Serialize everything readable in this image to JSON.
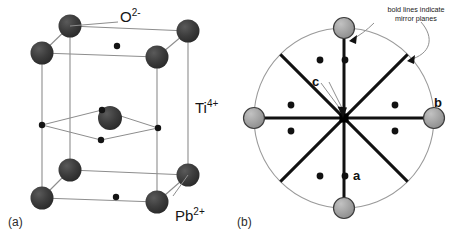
{
  "figure": {
    "kind": "crystal-structure-diagram",
    "background_color": "#ffffff",
    "ink_color": "#1a1a1a"
  },
  "panel_a": {
    "tag": "(a)",
    "description": "Perovskite tetragonal unit cell drawn in oblique projection",
    "labels": {
      "oxygen": {
        "element": "O",
        "charge": "2-",
        "text": "O2-"
      },
      "titanium": {
        "element": "Ti",
        "charge": "4+",
        "text": "Ti4+"
      },
      "lead": {
        "element": "Pb",
        "charge": "2+",
        "text": "Pb2+"
      }
    },
    "legend_colors": {
      "large_sphere": "#3a3a3a",
      "small_sphere": "#1a1a1a",
      "cell_edge": "#8a8a8a"
    },
    "atom_counts": {
      "large_corner_spheres": 8,
      "central_large_sphere": 1,
      "small_spheres": 6
    }
  },
  "panel_b": {
    "tag": "(b)",
    "description": "Projection down an axis showing mirror planes as bold lines through the centre",
    "note": "bold lines indicate\nmirror planes",
    "axis_labels": {
      "a": "a",
      "b": "b",
      "c": "c"
    },
    "colors": {
      "outer_circle": "#9a9a9a",
      "mirror_line": "#111111",
      "gray_sphere_fill": "#9e9e9e",
      "gray_sphere_stroke": "#3c3c3c",
      "small_dot": "#111111",
      "center_square": "#000000",
      "leader_line": "#8a8a8a"
    },
    "geometry": {
      "circle_center_x": 109,
      "circle_center_y": 118,
      "circle_radius": 90,
      "mirror_plane_count": 4,
      "mirror_plane_angles_deg": [
        0,
        45,
        90,
        135
      ],
      "gray_sphere_positions": [
        "top",
        "bottom",
        "left",
        "right"
      ],
      "small_dot_count": 8
    }
  }
}
